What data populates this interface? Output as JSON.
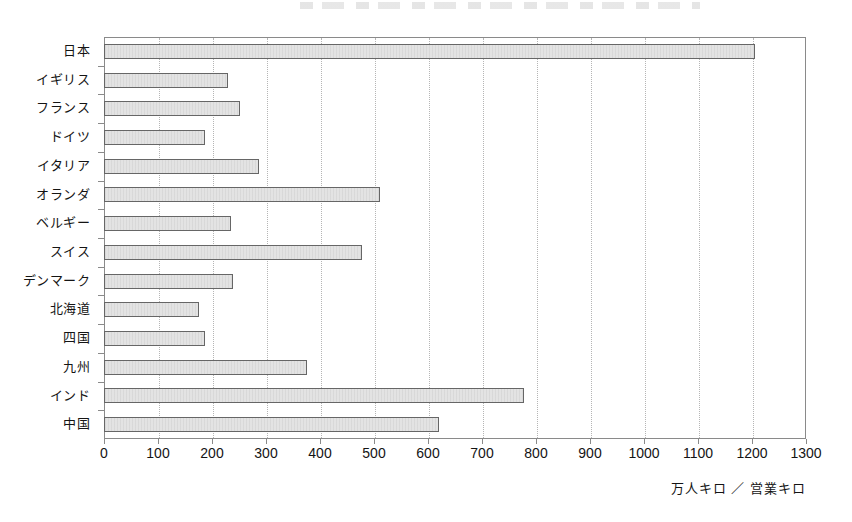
{
  "figure": {
    "unit_label": "万人キロ ／ 営業キロ",
    "axis_color": "#8a8a8a",
    "bar_fill": "#e3e3e3",
    "bar_border": "#666666",
    "gridline_color": "#b5b5b5",
    "background": "#ffffff"
  },
  "chart_data": {
    "type": "bar",
    "orientation": "horizontal",
    "title": "",
    "xlabel": "万人キロ ／ 営業キロ",
    "ylabel": "",
    "xlim": [
      0,
      1300
    ],
    "xticks": [
      0,
      100,
      200,
      300,
      400,
      500,
      600,
      700,
      800,
      900,
      1000,
      1100,
      1200,
      1300
    ],
    "xtick_labels": [
      "0",
      "100",
      "200",
      "300",
      "400",
      "500",
      "600",
      "700",
      "800",
      "900",
      "1000",
      "1100",
      "1200",
      "1300"
    ],
    "grid": "vertical-dotted",
    "legend": "none",
    "categories": [
      "日本",
      "イギリス",
      "フランス",
      "ドイツ",
      "イタリア",
      "オランダ",
      "ベルギー",
      "スイス",
      "デンマーク",
      "北海道",
      "四国",
      "九州",
      "インド",
      "中国"
    ],
    "values": [
      1205,
      230,
      252,
      187,
      287,
      512,
      236,
      478,
      238,
      176,
      187,
      375,
      778,
      620
    ]
  }
}
